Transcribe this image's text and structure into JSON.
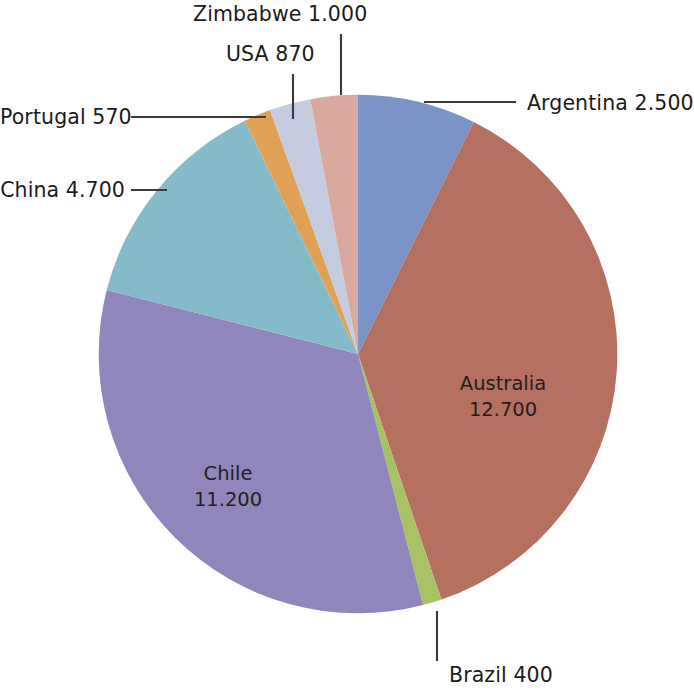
{
  "chart_data": {
    "type": "pie",
    "title": "",
    "subtitle": "",
    "xlabel": "",
    "ylabel": "",
    "legend_position": "none",
    "grid": false,
    "total": 33940,
    "start_angle_deg": -14,
    "direction": "clockwise",
    "categories": [
      "Argentina",
      "Australia",
      "Brazil",
      "Chile",
      "China",
      "Portugal",
      "USA",
      "Zimbabwe"
    ],
    "values": [
      2500,
      12700,
      400,
      11200,
      4700,
      570,
      870,
      1000
    ],
    "labels_formatted": [
      "2.500",
      "12.700",
      "400",
      "11.200",
      "4.700",
      "570",
      "870",
      "1.000"
    ],
    "slices": [
      {
        "name": "Argentina",
        "value": 2500,
        "value_text": "2.500",
        "label_text": "Argentina 2.500",
        "color": "#7b94c8",
        "label_style": "callout",
        "label_side": "right"
      },
      {
        "name": "Australia",
        "value": 12700,
        "value_text": "12.700",
        "label_line1": "Australia",
        "label_line2": "12.700",
        "color": "#b5705f",
        "label_style": "inside"
      },
      {
        "name": "Brazil",
        "value": 400,
        "value_text": "400",
        "label_text": "Brazil 400",
        "color": "#a8c163",
        "label_style": "callout",
        "label_side": "bottom"
      },
      {
        "name": "Chile",
        "value": 11200,
        "value_text": "11.200",
        "label_line1": "Chile",
        "label_line2": "11.200",
        "color": "#9186bb",
        "label_style": "inside"
      },
      {
        "name": "China",
        "value": 4700,
        "value_text": "4.700",
        "label_text": "China 4.700",
        "color": "#85bac8",
        "label_style": "callout",
        "label_side": "left"
      },
      {
        "name": "Portugal",
        "value": 570,
        "value_text": "570",
        "label_text": "Portugal 570",
        "color": "#e0a155",
        "label_style": "callout",
        "label_side": "left"
      },
      {
        "name": "USA",
        "value": 870,
        "value_text": "870",
        "label_text": "USA 870",
        "color": "#c5cce0",
        "label_style": "callout",
        "label_side": "top"
      },
      {
        "name": "Zimbabwe",
        "value": 1000,
        "value_text": "1.000",
        "label_text": "Zimbabwe 1.000",
        "color": "#d9a89e",
        "label_style": "callout",
        "label_side": "top"
      }
    ],
    "leader_line_color": "#3a3a3a"
  }
}
